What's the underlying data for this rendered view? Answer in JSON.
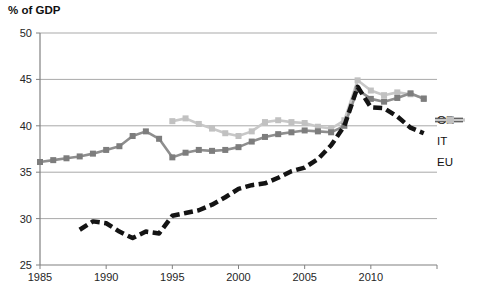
{
  "chart_data": {
    "type": "line",
    "title": "% of GDP",
    "xlabel": "",
    "ylabel": "% of GDP",
    "x_range": [
      1985,
      2015
    ],
    "x_ticks": [
      1985,
      1990,
      1995,
      2000,
      2005,
      2010
    ],
    "ylim": [
      25,
      50
    ],
    "y_ticks": [
      25,
      30,
      35,
      40,
      45,
      50
    ],
    "grid": "horizontal",
    "legend_position": "right",
    "colors": {
      "gridline": "#a9a9a9",
      "axis": "#808080",
      "axis_text": "#262626"
    },
    "series": [
      {
        "name": "GR",
        "style": "dashed",
        "color": "#141414",
        "line_width": 4.5,
        "start_year": 1988,
        "values": [
          28.8,
          29.7,
          29.5,
          28.6,
          27.9,
          28.6,
          28.4,
          30.3,
          30.6,
          30.9,
          31.5,
          32.3,
          33.2,
          33.6,
          33.8,
          34.4,
          35.1,
          35.5,
          36.4,
          37.9,
          40.0,
          44.2,
          42.0,
          41.9,
          41.0,
          39.8,
          39.2
        ]
      },
      {
        "name": "IT",
        "style": "solid-square",
        "color": "#8e8e8e",
        "marker_color": "#7d7d7d",
        "line_width": 2.6,
        "start_year": 1985,
        "values": [
          36.1,
          36.3,
          36.5,
          36.7,
          37.0,
          37.4,
          37.8,
          38.9,
          39.4,
          38.6,
          36.6,
          37.1,
          37.4,
          37.3,
          37.4,
          37.7,
          38.3,
          38.8,
          39.1,
          39.3,
          39.5,
          39.4,
          39.3,
          40.0,
          43.9,
          42.9,
          42.6,
          43.0,
          43.5,
          42.9
        ]
      },
      {
        "name": "EU",
        "style": "solid-square",
        "color": "#c8c8c8",
        "marker_color": "#c1c1c1",
        "line_width": 2.6,
        "start_year": 1995,
        "values": [
          40.5,
          40.8,
          40.2,
          39.7,
          39.2,
          38.9,
          39.4,
          40.4,
          40.6,
          40.4,
          40.3,
          39.9,
          39.7,
          40.6,
          44.9,
          43.8,
          43.3,
          43.6,
          43.4,
          43.0
        ]
      }
    ]
  }
}
